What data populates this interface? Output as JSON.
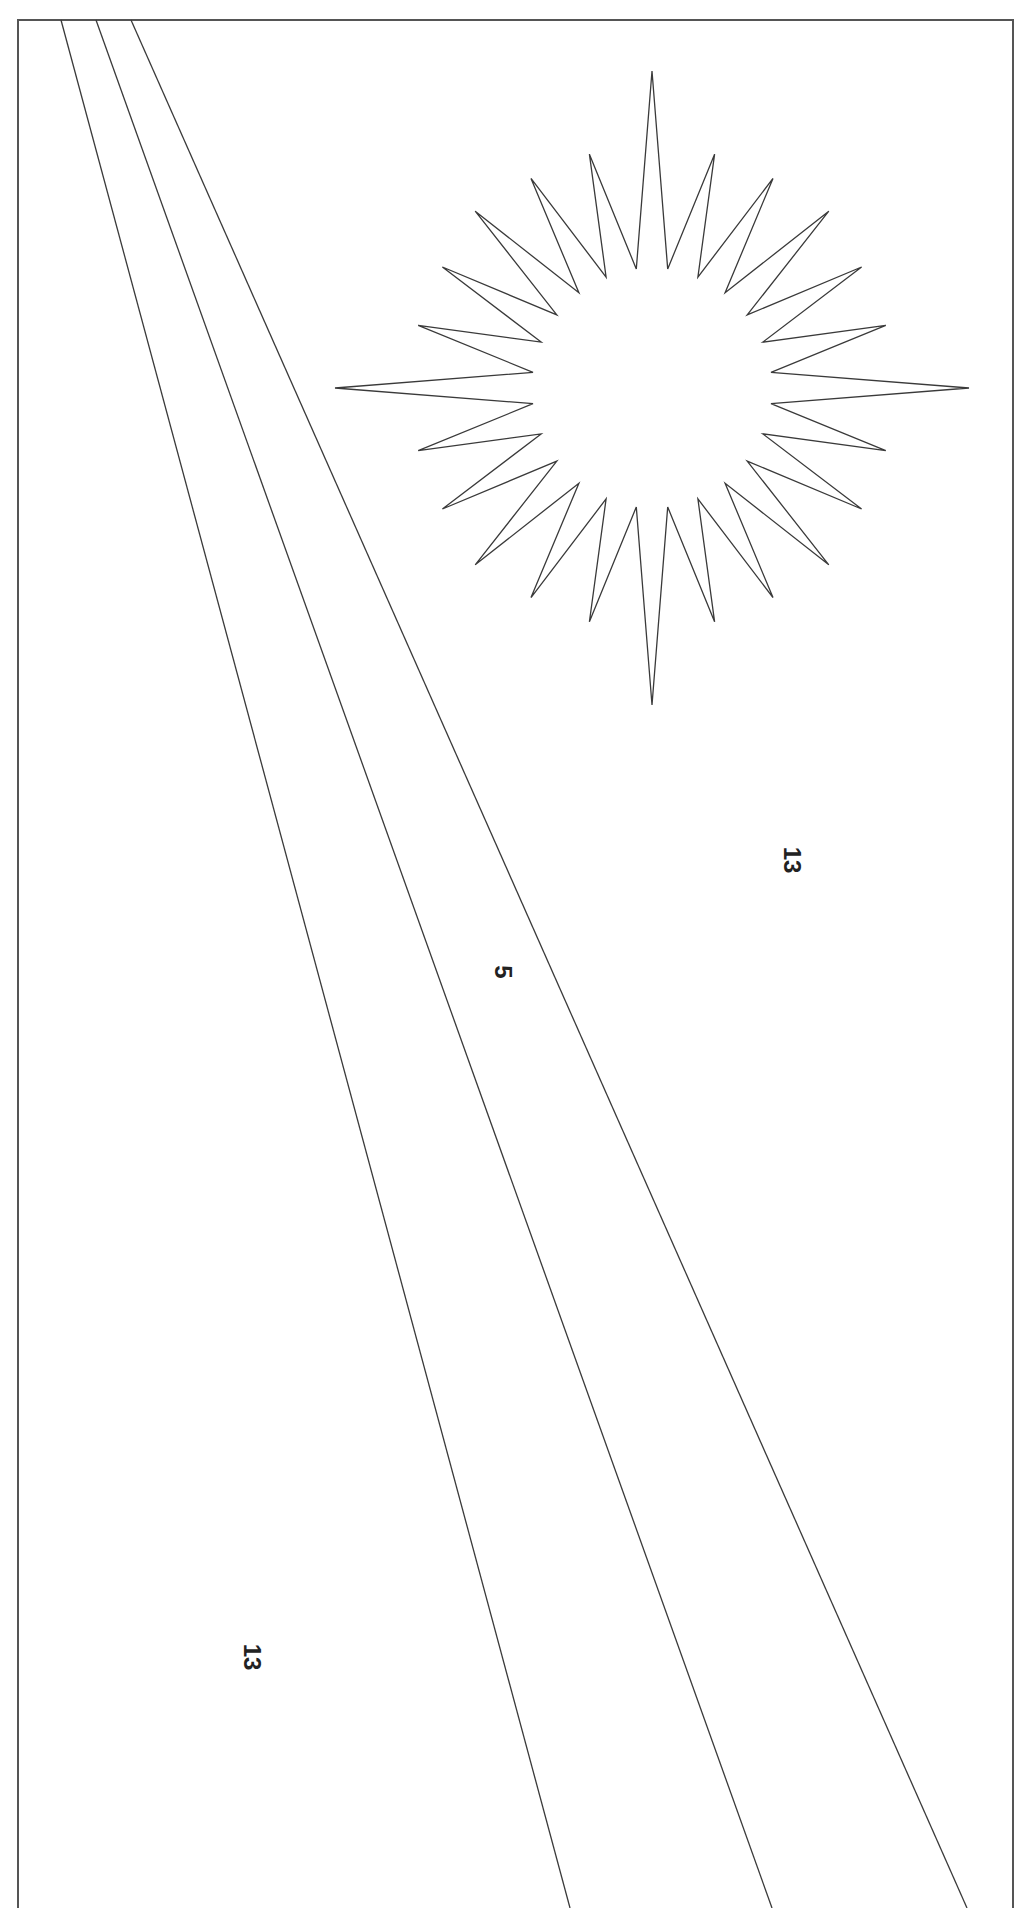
{
  "page": {
    "type": "coloring-page",
    "background": "#ffffff",
    "stroke_color": "#3a3a3a",
    "border_color": "#555555"
  },
  "frame": {
    "left": 18,
    "top": 20,
    "right": 1013,
    "bottom": 1908,
    "bottom_open": true
  },
  "stripes": [
    {
      "name": "stripe-line-1",
      "x1": 61,
      "y1": 20,
      "x2": 570,
      "y2": 1908
    },
    {
      "name": "stripe-line-2",
      "x1": 96,
      "y1": 20,
      "x2": 772,
      "y2": 1908
    },
    {
      "name": "stripe-line-3",
      "x1": 131,
      "y1": 20,
      "x2": 967,
      "y2": 1908
    }
  ],
  "star": {
    "cx": 652,
    "cy": 388,
    "points": 24,
    "outer_radius_cardinal": 317,
    "outer_radius_diagonal": 250,
    "outer_radius_other": 242,
    "inner_radius": 120
  },
  "labels": [
    {
      "name": "region-label-upper-right",
      "text": "13",
      "x": 792,
      "y": 860
    },
    {
      "name": "region-label-stripe",
      "text": "5",
      "x": 503,
      "y": 972
    },
    {
      "name": "region-label-lower-left",
      "text": "13",
      "x": 252,
      "y": 1657
    }
  ]
}
